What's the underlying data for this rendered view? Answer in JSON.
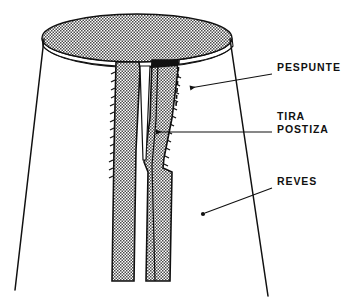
{
  "diagram": {
    "language": "es",
    "background_color": "#ffffff",
    "ink_color": "#111111",
    "stipple_color": "#4a4a4a",
    "labels": [
      {
        "id": "pespunte",
        "text": "PESPUNTE",
        "text_x": 277,
        "text_y": 71,
        "leader_from_x": 272,
        "leader_from_y": 74,
        "leader_to_x": 186,
        "leader_to_y": 88,
        "arrow": "left-arrowhead",
        "points_to": "dashed-stitch-line"
      },
      {
        "id": "tira-postiza",
        "text_line_1": "TIRA",
        "text_line_2": "POSTIZA",
        "text_x": 277,
        "text_y": 120,
        "text_y2": 133,
        "leader_from_x": 272,
        "leader_from_y": 132,
        "leader_to_x": 152,
        "leader_to_y": 132,
        "arrow": "left-arrowhead",
        "points_to": "applied-strip"
      },
      {
        "id": "reves",
        "text": "REVES",
        "text_x": 277,
        "text_y": 185,
        "leader_from_x": 272,
        "leader_from_y": 188,
        "leader_to_x": 203,
        "leader_to_y": 213,
        "arrow": "dot",
        "points_to": "reverse-face"
      }
    ],
    "shapes": {
      "top_ellipse": {
        "cx": 137,
        "cy": 38,
        "rx": 95,
        "ry": 24,
        "fill": "stipple"
      },
      "rim_band_depth": 16,
      "left_silhouette": {
        "x1": 44,
        "y1": 40,
        "x2": 15,
        "y2": 290
      },
      "right_silhouette": {
        "x1": 230,
        "y1": 40,
        "x2": 268,
        "y2": 295
      },
      "left_strip": {
        "top_x": 116,
        "bottom_x": 112,
        "top_y": 62,
        "bottom_y": 281,
        "serrated_edge": "left"
      },
      "right_strip": {
        "top_x": 152,
        "bottom_x": 160,
        "top_y": 60,
        "bottom_y": 281,
        "serrated_edge": "right"
      },
      "dashed_stitch_line": {
        "x": 178,
        "y_top": 62,
        "y_bottom": 105
      }
    }
  }
}
